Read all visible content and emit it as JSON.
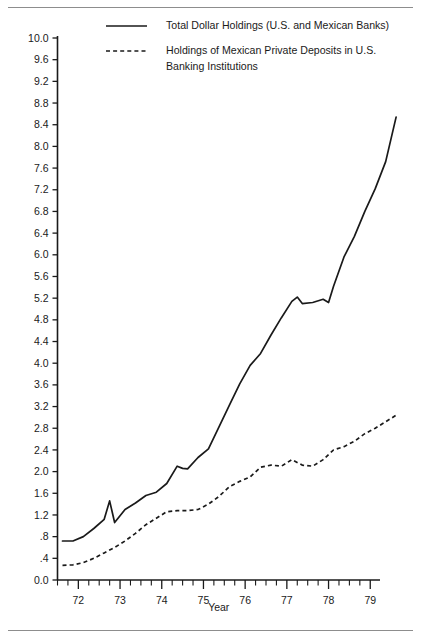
{
  "chart_data": {
    "type": "line",
    "title": "",
    "xlabel": "Year",
    "ylabel": "",
    "xlim": [
      71.5,
      79.9
    ],
    "ylim": [
      0.0,
      10.0
    ],
    "grid": false,
    "legend_position": "top-center",
    "ytick_labels": [
      "10.0",
      "9.6",
      "9.2",
      "8.8",
      "8.4",
      "8.0",
      "7.6",
      "7.2",
      "6.8",
      "6.4",
      "6.0",
      "5.6",
      "5.2",
      "4.8",
      "4.4",
      "4.0",
      "3.6",
      "3.2",
      "2.8",
      "2.4",
      "2.0",
      "1.6",
      "1.2",
      ".8",
      ".4",
      "0.0"
    ],
    "ytick_values": [
      10.0,
      9.6,
      9.2,
      8.8,
      8.4,
      8.0,
      7.6,
      7.2,
      6.8,
      6.4,
      6.0,
      5.6,
      5.2,
      4.8,
      4.4,
      4.0,
      3.6,
      3.2,
      2.8,
      2.4,
      2.0,
      1.6,
      1.2,
      0.8,
      0.4,
      0.0
    ],
    "xtick_labels": [
      "72",
      "73",
      "74",
      "75",
      "76",
      "77",
      "78",
      "79"
    ],
    "xtick_values": [
      72,
      73,
      74,
      75,
      76,
      77,
      78,
      79
    ],
    "minor_xticks_per_year": 4,
    "series": [
      {
        "name": "Total Dollar Holdings (U.S. and Mexican Banks)",
        "style": "solid",
        "x": [
          71.62,
          71.87,
          72.12,
          72.37,
          72.62,
          72.75,
          72.87,
          73.12,
          73.37,
          73.62,
          73.87,
          74.12,
          74.37,
          74.5,
          74.62,
          74.87,
          75.12,
          75.37,
          75.62,
          75.87,
          76.12,
          76.37,
          76.62,
          76.87,
          77.12,
          77.25,
          77.37,
          77.62,
          77.87,
          78.0,
          78.12,
          78.37,
          78.62,
          78.87,
          79.12,
          79.37,
          79.62
        ],
        "y": [
          0.72,
          0.72,
          0.8,
          0.95,
          1.12,
          1.46,
          1.06,
          1.3,
          1.42,
          1.56,
          1.62,
          1.78,
          2.1,
          2.06,
          2.05,
          2.26,
          2.42,
          2.82,
          3.22,
          3.62,
          3.96,
          4.18,
          4.52,
          4.84,
          5.14,
          5.22,
          5.1,
          5.12,
          5.18,
          5.12,
          5.42,
          5.96,
          6.34,
          6.8,
          7.22,
          7.72,
          8.54
        ]
      },
      {
        "name": "Holdings of Mexican Private Deposits in U.S. Banking Institutions",
        "style": "dashed",
        "x": [
          71.62,
          71.87,
          72.12,
          72.37,
          72.62,
          72.87,
          73.12,
          73.37,
          73.62,
          73.87,
          74.12,
          74.37,
          74.62,
          74.87,
          75.12,
          75.37,
          75.62,
          75.87,
          76.12,
          76.37,
          76.62,
          76.87,
          77.12,
          77.37,
          77.62,
          77.87,
          78.12,
          78.37,
          78.62,
          78.87,
          79.12,
          79.37,
          79.62
        ],
        "y": [
          0.27,
          0.28,
          0.32,
          0.4,
          0.5,
          0.6,
          0.72,
          0.86,
          1.02,
          1.14,
          1.26,
          1.28,
          1.28,
          1.3,
          1.4,
          1.54,
          1.72,
          1.82,
          1.9,
          2.08,
          2.12,
          2.1,
          2.22,
          2.12,
          2.1,
          2.22,
          2.4,
          2.46,
          2.56,
          2.7,
          2.8,
          2.92,
          3.04
        ]
      }
    ]
  },
  "legend": {
    "entries": [
      {
        "label": "Total Dollar Holdings (U.S. and Mexican Banks)",
        "style": "solid"
      },
      {
        "label": "Holdings of Mexican Private Deposits in U.S.",
        "label2": "Banking Institutions",
        "style": "dashed"
      }
    ]
  },
  "colors": {
    "ink": "#1a1a1a",
    "rule": "#8d8d8d",
    "background": "#ffffff"
  }
}
